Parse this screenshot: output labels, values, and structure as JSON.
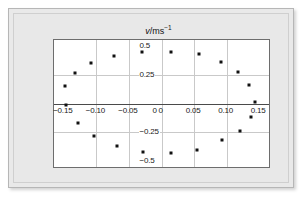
{
  "figure": {
    "axis_titles": {
      "y": "v/ms⁻¹",
      "y_var": "v",
      "y_unit": "/ms",
      "y_exp": "−1",
      "x": "s/m",
      "x_var": "s",
      "x_unit": "/m"
    }
  },
  "chart_data": {
    "type": "scatter",
    "title": "",
    "xlabel": "s/m",
    "ylabel": "v/ms⁻¹",
    "xlim": [
      -0.165,
      0.165
    ],
    "ylim": [
      -0.55,
      0.55
    ],
    "xticks": [
      -0.15,
      -0.1,
      -0.05,
      0,
      0.05,
      0.1,
      0.15
    ],
    "xticklabels": [
      "−0.15",
      "−0.10",
      "−0.05",
      "0",
      "0.05",
      "0.10",
      "0.15"
    ],
    "yticks": [
      0.5,
      0.25,
      0,
      -0.25,
      -0.5
    ],
    "yticklabels": [
      "0.5",
      "0.25",
      "0",
      "−0.25",
      "−0.5"
    ],
    "grid": true,
    "legend": null,
    "points": [
      {
        "x": -0.148,
        "y": 0.155
      },
      {
        "x": -0.133,
        "y": 0.265
      },
      {
        "x": -0.108,
        "y": 0.355
      },
      {
        "x": -0.073,
        "y": 0.415
      },
      {
        "x": -0.03,
        "y": 0.45
      },
      {
        "x": 0.014,
        "y": 0.45
      },
      {
        "x": 0.057,
        "y": 0.425
      },
      {
        "x": 0.092,
        "y": 0.36
      },
      {
        "x": 0.118,
        "y": 0.27
      },
      {
        "x": 0.135,
        "y": 0.16
      },
      {
        "x": 0.143,
        "y": 0.01
      },
      {
        "x": 0.138,
        "y": -0.115
      },
      {
        "x": 0.12,
        "y": -0.235
      },
      {
        "x": 0.093,
        "y": -0.32
      },
      {
        "x": 0.055,
        "y": -0.405
      },
      {
        "x": 0.014,
        "y": -0.43
      },
      {
        "x": -0.028,
        "y": -0.42
      },
      {
        "x": -0.069,
        "y": -0.365
      },
      {
        "x": -0.103,
        "y": -0.28
      },
      {
        "x": -0.128,
        "y": -0.165
      },
      {
        "x": -0.146,
        "y": -0.01
      }
    ]
  }
}
